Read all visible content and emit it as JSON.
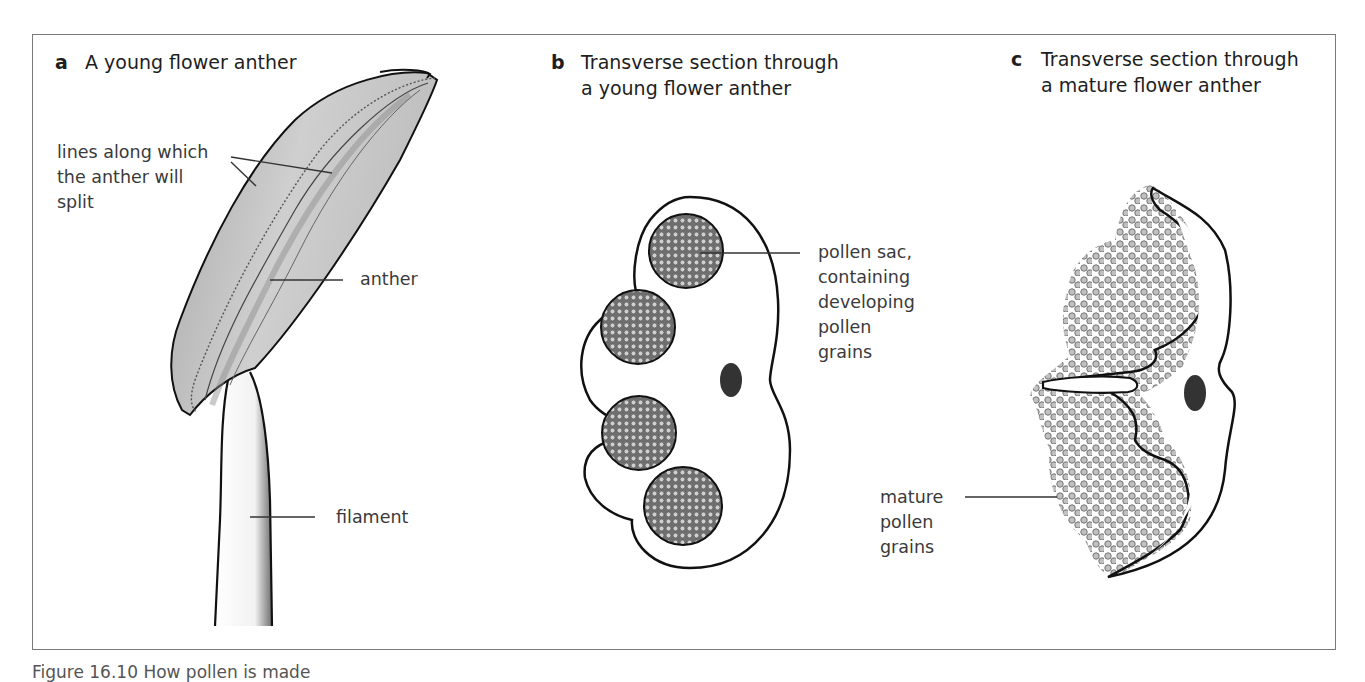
{
  "figure": {
    "caption": "Figure 16.10  How pollen is made",
    "panels": [
      {
        "letter": "a",
        "title": "A young flower anther",
        "labels": {
          "split_lines": "lines along which\nthe anther will\nsplit",
          "anther": "anther",
          "filament": "filament"
        }
      },
      {
        "letter": "b",
        "title": "Transverse section through\na young flower anther",
        "labels": {
          "pollen_sac": "pollen sac,\ncontaining\ndeveloping\npollen\ngrains"
        }
      },
      {
        "letter": "c",
        "title": "Transverse section through\na mature flower anther",
        "labels": {
          "mature_pollen": "mature\npollen\ngrains"
        }
      }
    ]
  },
  "colors": {
    "frame": "#7a7a7a",
    "anther_fill": "#c9c9c9",
    "anther_shade": "#9e9e9e",
    "outline": "#111111",
    "pollen_sac_fill": "#8a8a8a",
    "pollen_grain": "#b5b5b5",
    "vascular_bundle": "#333333",
    "leader_line": "#333333"
  }
}
